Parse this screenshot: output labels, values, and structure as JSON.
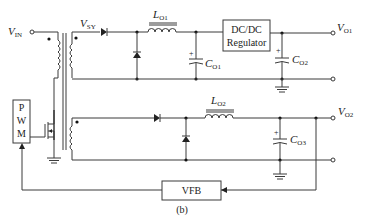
{
  "diagram": {
    "caption": "(b)",
    "type": "flyback converter with secondary post-regulator and feedback",
    "labels": {
      "vin": "V",
      "vin_sub": "IN",
      "vsy": "V",
      "vsy_sub": "SY",
      "lo1": "L",
      "lo1_sub": "O1",
      "lo2": "L",
      "lo2_sub": "O2",
      "co1": "C",
      "co1_sub": "O1",
      "co2": "C",
      "co2_sub": "O2",
      "co3": "C",
      "co3_sub": "O3",
      "vo1": "V",
      "vo1_sub": "O1",
      "vo2": "V",
      "vo2_sub": "O2",
      "plus": "+"
    },
    "blocks": {
      "regulator_line1": "DC/DC",
      "regulator_line2": "Regulator",
      "vfb": "VFB",
      "pwm_p": "P",
      "pwm_w": "W",
      "pwm_m": "M"
    },
    "colors": {
      "wire": "#3a3a3a",
      "background": "#ffffff"
    }
  }
}
